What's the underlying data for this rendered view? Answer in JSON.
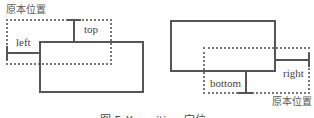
{
  "left_diagram": {
    "original_label": "原本位置",
    "top_label": "top",
    "left_label": "left"
  },
  "right_diagram": {
    "original_label": "原本位置",
    "bottom_label": "bottom",
    "right_label": "right"
  },
  "caption": "图 5-X position 定位"
}
